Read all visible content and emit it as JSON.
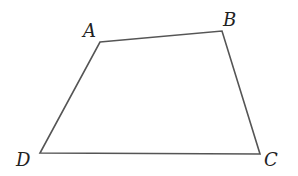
{
  "diagram": {
    "type": "quadrilateral",
    "stroke_color": "#555555",
    "vertices": [
      {
        "label": "A",
        "x": 100,
        "y": 42
      },
      {
        "label": "B",
        "x": 222,
        "y": 31
      },
      {
        "label": "C",
        "x": 260,
        "y": 154
      },
      {
        "label": "D",
        "x": 40,
        "y": 153
      }
    ]
  }
}
